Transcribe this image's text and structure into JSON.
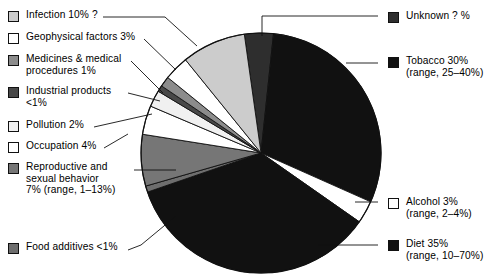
{
  "chart_data": {
    "type": "pie",
    "title": "",
    "units": "percent of total",
    "legend_position": "left-and-right",
    "note": "Slice labels include point estimates and, where given, plausible ranges.",
    "categories": [
      "Unknown ? %",
      "Tobacco 30%",
      "Alcohol 3%",
      "Diet 35%",
      "Food additives <1%",
      "Reproductive and sexual behavior 7%",
      "Occupation 4%",
      "Pollution 2%",
      "Industrial products <1%",
      "Medicines & medical procedures 1%",
      "Geophysical factors 3%",
      "Infection 10%"
    ],
    "values": [
      4,
      30,
      3,
      35,
      0.7,
      7,
      4,
      2,
      0.7,
      1,
      3,
      10
    ],
    "slices": [
      {
        "name": "Unknown",
        "label": "Unknown ? %",
        "value": 4,
        "value_text": "? %",
        "range": null,
        "color": "#2e2e2e",
        "start_deg": 352,
        "end_deg": 366
      },
      {
        "name": "Tobacco",
        "label": "Tobacco 30%",
        "value": 30,
        "value_text": "30%",
        "range": "range, 25–40%",
        "color": "#111111",
        "start_deg": 366,
        "end_deg": 474
      },
      {
        "name": "Alcohol",
        "label": "Alcohol 3%",
        "value": 3,
        "value_text": "3%",
        "range": "range, 2–4%",
        "color": "#ffffff",
        "start_deg": 474,
        "end_deg": 485
      },
      {
        "name": "Diet",
        "label": "Diet 35%",
        "value": 35,
        "value_text": "35%",
        "range": "range, 10–70%",
        "color": "#111111",
        "start_deg": 485,
        "end_deg": 611
      },
      {
        "name": "Food additives",
        "label": "Food additives <1%",
        "value": 0.7,
        "value_text": "<1%",
        "range": null,
        "color": "#6e6e6e",
        "start_deg": 611,
        "end_deg": 614
      },
      {
        "name": "Reproductive and sexual behavior",
        "label": "Reproductive and sexual behavior 7%",
        "value": 7,
        "value_text": "7%",
        "range": "range, 1–13%",
        "color": "#767676",
        "start_deg": 614,
        "end_deg": 639
      },
      {
        "name": "Occupation",
        "label": "Occupation 4%",
        "value": 4,
        "value_text": "4%",
        "range": null,
        "color": "#ffffff",
        "start_deg": 639,
        "end_deg": 653
      },
      {
        "name": "Pollution",
        "label": "Pollution 2%",
        "value": 2,
        "value_text": "2%",
        "range": null,
        "color": "#f0f0f0",
        "start_deg": 653,
        "end_deg": 661
      },
      {
        "name": "Industrial products",
        "label": "Industrial products <1%",
        "value": 0.7,
        "value_text": "<1%",
        "range": null,
        "color": "#484848",
        "start_deg": 661,
        "end_deg": 664
      },
      {
        "name": "Medicines & medical procedures",
        "label": "Medicines & medical procedures 1%",
        "value": 1,
        "value_text": "1%",
        "range": null,
        "color": "#8c8c8c",
        "start_deg": 664,
        "end_deg": 669
      },
      {
        "name": "Geophysical factors",
        "label": "Geophysical factors 3%",
        "value": 3,
        "value_text": "3%",
        "range": null,
        "color": "#ffffff",
        "start_deg": 669,
        "end_deg": 681
      },
      {
        "name": "Infection",
        "label": "Infection 10%",
        "value": 10,
        "value_text": "10%",
        "range": null,
        "color": "#cccccc",
        "start_deg": 681,
        "end_deg": 712
      }
    ],
    "geometry": {
      "cx": 261,
      "cy": 153,
      "r": 120
    }
  },
  "legend_left": [
    {
      "id": "infection",
      "text": "Infection 10% ?",
      "color": "#cccccc",
      "x": 8,
      "y": 9
    },
    {
      "id": "geophysical-factors",
      "text": "Geophysical factors 3%",
      "color": "#ffffff",
      "x": 8,
      "y": 31
    },
    {
      "id": "medicines-medical-procedures",
      "text": "Medicines & medical\nprocedures 1%",
      "color": "#8c8c8c",
      "x": 8,
      "y": 53
    },
    {
      "id": "industrial-products",
      "text": "Industrial products\n<1%",
      "color": "#484848",
      "x": 8,
      "y": 85
    },
    {
      "id": "pollution",
      "text": "Pollution 2%",
      "color": "#f0f0f0",
      "x": 8,
      "y": 119
    },
    {
      "id": "occupation",
      "text": "Occupation 4%",
      "color": "#ffffff",
      "x": 8,
      "y": 140
    },
    {
      "id": "reproductive-sexual-behavior",
      "text": "Reproductive and\nsexual behavior\n7% (range, 1–13%)",
      "color": "#767676",
      "x": 8,
      "y": 161
    },
    {
      "id": "food-additives",
      "text": "Food additives <1%",
      "color": "#6e6e6e",
      "x": 8,
      "y": 241
    }
  ],
  "legend_right": [
    {
      "id": "unknown",
      "text": "Unknown ? %",
      "color": "#2e2e2e",
      "x": 388,
      "y": 10
    },
    {
      "id": "tobacco",
      "text": "Tobacco 30%\n(range, 25–40%)",
      "color": "#111111",
      "x": 388,
      "y": 55
    },
    {
      "id": "alcohol",
      "text": "Alcohol 3%\n(range, 2–4%)",
      "color": "#ffffff",
      "x": 388,
      "y": 196
    },
    {
      "id": "diet",
      "text": "Diet 35%\n(range, 10–70%)",
      "color": "#111111",
      "x": 388,
      "y": 238
    }
  ]
}
